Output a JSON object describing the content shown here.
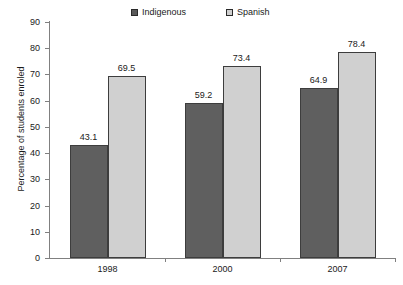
{
  "chart_data": {
    "type": "bar",
    "title": "",
    "subtitle": "",
    "xlabel": "",
    "ylabel": "Percentage of students enroled",
    "categories": [
      "1998",
      "2000",
      "2007"
    ],
    "series": [
      {
        "name": "Indigenous",
        "color": "#5f5f5f",
        "values": [
          43.1,
          59.2,
          64.9
        ]
      },
      {
        "name": "Spanish",
        "color": "#d0d0d0",
        "values": [
          69.5,
          73.4,
          78.4
        ]
      }
    ],
    "ylim": [
      0,
      90
    ],
    "ytick_step": 10,
    "yticks": [
      0,
      10,
      20,
      30,
      40,
      50,
      60,
      70,
      80,
      90
    ],
    "ytick_labels": [
      "0",
      "10",
      "20",
      "30",
      "40",
      "50",
      "60",
      "70",
      "80",
      "90"
    ],
    "data_labels": [
      [
        "43.1",
        "69.5"
      ],
      [
        "59.2",
        "73.4"
      ],
      [
        "64.9",
        "78.4"
      ]
    ],
    "grid": false,
    "legend_position": "top-center",
    "legend_entries": [
      "Indigenous",
      "Spanish"
    ]
  },
  "legend": {
    "entries": [
      {
        "label": "Indigenous",
        "swatch": "legend-swatch-indigenous"
      },
      {
        "label": "Spanish",
        "swatch": "legend-swatch-spanish"
      }
    ]
  },
  "axes": {
    "y_title": "Percentage of students enroled"
  }
}
